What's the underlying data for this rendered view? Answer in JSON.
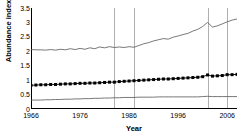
{
  "chart_data": {
    "type": "line",
    "title": "",
    "xlabel": "Year",
    "ylabel": "Abundance index",
    "xlim": [
      1966,
      2008
    ],
    "ylim": [
      0,
      3.5
    ],
    "ytick_labels": [
      "3.5",
      "3",
      "2.5",
      "2",
      "1.5",
      "1",
      "0.5",
      "0"
    ],
    "ytick_values": [
      3.5,
      3,
      2.5,
      2,
      1.5,
      1,
      0.5,
      0
    ],
    "xtick_labels": [
      "1966",
      "1976",
      "1986",
      "1996",
      "2006"
    ],
    "xtick_values": [
      1966,
      1976,
      1986,
      1996,
      2006
    ],
    "grid": "vertical reference lines only",
    "vertical_reference_lines": [
      1983,
      1987,
      2002,
      2006
    ],
    "legend": "none",
    "x": [
      1966,
      1967,
      1968,
      1969,
      1970,
      1971,
      1972,
      1973,
      1974,
      1975,
      1976,
      1977,
      1978,
      1979,
      1980,
      1981,
      1982,
      1983,
      1984,
      1985,
      1986,
      1987,
      1988,
      1989,
      1990,
      1991,
      1992,
      1993,
      1994,
      1995,
      1996,
      1997,
      1998,
      1999,
      2000,
      2001,
      2002,
      2003,
      2004,
      2005,
      2006,
      2007,
      2008
    ],
    "series": [
      {
        "name": "upper-series",
        "style": "thin-line",
        "color": "#555555",
        "values": [
          2.06,
          2.05,
          2.05,
          2.04,
          2.06,
          2.04,
          2.07,
          2.05,
          2.09,
          2.06,
          2.1,
          2.07,
          2.12,
          2.09,
          2.15,
          2.12,
          2.16,
          2.13,
          2.15,
          2.13,
          2.16,
          2.14,
          2.2,
          2.26,
          2.3,
          2.36,
          2.4,
          2.44,
          2.42,
          2.49,
          2.53,
          2.58,
          2.62,
          2.7,
          2.76,
          2.86,
          3.0,
          2.84,
          2.88,
          2.95,
          3.02,
          3.08,
          3.12
        ]
      },
      {
        "name": "middle-series-markers",
        "style": "line-with-square-markers",
        "color": "#000000",
        "values": [
          0.82,
          0.83,
          0.84,
          0.84,
          0.85,
          0.85,
          0.86,
          0.87,
          0.87,
          0.88,
          0.89,
          0.89,
          0.9,
          0.9,
          0.91,
          0.92,
          0.93,
          0.93,
          0.95,
          0.96,
          0.97,
          0.98,
          0.99,
          1.0,
          1.01,
          1.02,
          1.03,
          1.04,
          1.04,
          1.05,
          1.06,
          1.07,
          1.08,
          1.09,
          1.1,
          1.12,
          1.18,
          1.14,
          1.15,
          1.16,
          1.19,
          1.19,
          1.2
        ]
      },
      {
        "name": "lower-series",
        "style": "thin-line",
        "color": "#555555",
        "values": [
          0.31,
          0.31,
          0.31,
          0.32,
          0.32,
          0.33,
          0.33,
          0.34,
          0.34,
          0.35,
          0.35,
          0.36,
          0.36,
          0.37,
          0.37,
          0.38,
          0.38,
          0.39,
          0.39,
          0.4,
          0.4,
          0.4,
          0.41,
          0.41,
          0.41,
          0.41,
          0.42,
          0.42,
          0.42,
          0.42,
          0.42,
          0.42,
          0.42,
          0.42,
          0.42,
          0.43,
          0.44,
          0.43,
          0.43,
          0.43,
          0.43,
          0.43,
          0.43
        ]
      }
    ]
  }
}
